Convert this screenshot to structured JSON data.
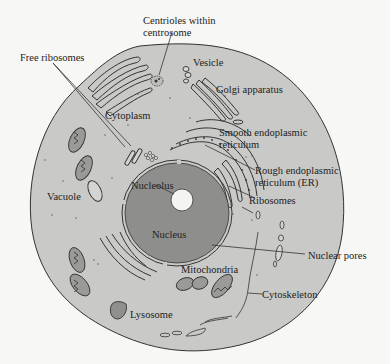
{
  "diagram": {
    "colors": {
      "background": "#f7f7f5",
      "cytoplasm": "#c9c9c7",
      "nucleus": "#8e8e8c",
      "nucleolus": "#f4f4f2",
      "outline": "#333333",
      "mitochondria": "#9a9a98",
      "lysosome": "#8f8f8d"
    },
    "labels": {
      "free_ribosomes": "Free ribosomes",
      "centrioles_line1": "Centrioles within",
      "centrioles_line2": "centrosome",
      "vesicle": "Vesicle",
      "golgi": "Golgi apparatus",
      "cytoplasm": "Cytoplasm",
      "smooth_er_line1": "Smooth endoplasmic",
      "smooth_er_line2": "reticulum",
      "rough_er_line1": "Rough endoplasmic",
      "rough_er_line2": "reticulum (ER)",
      "ribosomes": "Ribosomes",
      "vacuole": "Vacuole",
      "nucleolus": "Nucleolus",
      "nucleus": "Nucleus",
      "nuclear_pores": "Nuclear pores",
      "mitochondria": "Mitochondria",
      "cytoskeleton": "Cytoskeleton",
      "lysosome": "Lysosome"
    }
  }
}
